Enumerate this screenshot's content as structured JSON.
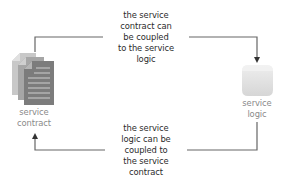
{
  "diagram": {
    "type": "cycle",
    "nodes": [
      {
        "id": "service-contract",
        "label_lines": [
          "service",
          "contract"
        ],
        "icon": "document-stack-icon",
        "color": "#8a8a8a"
      },
      {
        "id": "service-logic",
        "label_lines": [
          "service",
          "logic"
        ],
        "icon": "rounded-square-icon",
        "color": "#dcdcdc"
      }
    ],
    "edges": [
      {
        "from": "service-contract",
        "to": "service-logic",
        "caption_lines": [
          "the service",
          "contract can",
          "be coupled",
          "to the service",
          "logic"
        ]
      },
      {
        "from": "service-logic",
        "to": "service-contract",
        "caption_lines": [
          "the service",
          "logic can be",
          "coupled to",
          "the service",
          "contract"
        ]
      }
    ],
    "colors": {
      "line": "#555555",
      "caption_text": "#2b2b2b",
      "label_text": "#8a8a8a",
      "document_dark": "#7c7c7c",
      "document_mid": "#a6a6a6",
      "document_light": "#c8c8c8",
      "logic_box": "#e2e2e2"
    }
  }
}
